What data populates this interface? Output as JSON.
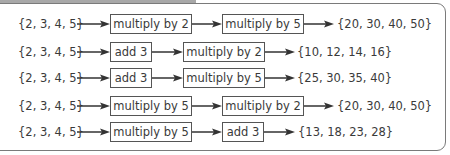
{
  "diagram": {
    "rows": [
      {
        "input": "{2, 3, 4, 5}",
        "step1": "multiply by 2",
        "step2": "multiply by 5",
        "output": "{20, 30, 40, 50}"
      },
      {
        "input": "{2, 3, 4, 5}",
        "step1": "add 3",
        "step2": "multiply by 2",
        "output": "{10, 12, 14, 16}"
      },
      {
        "input": "{2, 3, 4, 5}",
        "step1": "add 3",
        "step2": "multiply by 5",
        "output": "{25, 30, 35, 40}"
      },
      {
        "input": "{2, 3, 4, 5}",
        "step1": "multiply by 5",
        "step2": "multiply by 2",
        "output": "{20, 30, 40, 50}"
      },
      {
        "input": "{2, 3, 4, 5}",
        "step1": "multiply by 5",
        "step2": "add 3",
        "output": "{13, 18, 23, 28}"
      }
    ]
  }
}
